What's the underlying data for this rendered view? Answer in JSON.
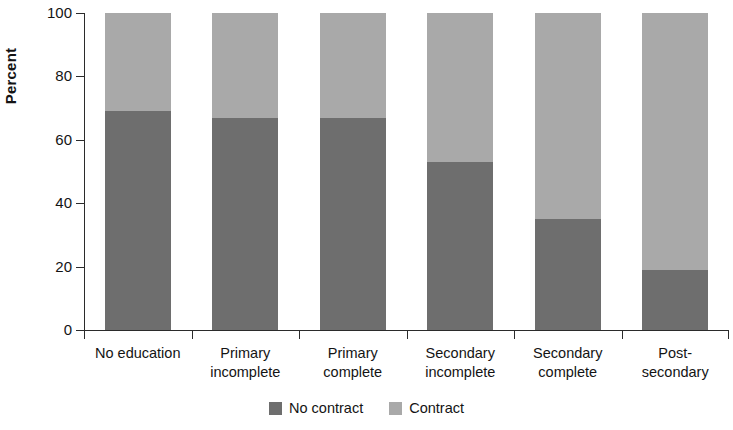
{
  "chart_data": {
    "type": "bar",
    "subtype": "stacked-100-percent-vertical",
    "title": "",
    "subtitle": "",
    "xlabel": "",
    "ylabel": "Percent",
    "ylim": [
      0,
      100
    ],
    "yticks": [
      0,
      20,
      40,
      60,
      80,
      100
    ],
    "ytick_labels": [
      "0",
      "20",
      "40",
      "60",
      "80",
      "100"
    ],
    "grid": false,
    "legend_position": "bottom-center",
    "categories": [
      "No education",
      "Primary incomplete",
      "Primary complete",
      "Secondary incomplete",
      "Secondary complete",
      "Post-secondary"
    ],
    "category_lines": [
      [
        "No education"
      ],
      [
        "Primary",
        "incomplete"
      ],
      [
        "Primary",
        "complete"
      ],
      [
        "Secondary",
        "incomplete"
      ],
      [
        "Secondary",
        "complete"
      ],
      [
        "Post-",
        "secondary"
      ]
    ],
    "series": [
      {
        "name": "No contract",
        "color": "#6e6e6e",
        "values": [
          69,
          67,
          67,
          53,
          35,
          19
        ]
      },
      {
        "name": "Contract",
        "color": "#a9a9a9",
        "values": [
          31,
          33,
          33,
          47,
          65,
          81
        ]
      }
    ],
    "legend": [
      {
        "label": "No contract",
        "color": "#6e6e6e"
      },
      {
        "label": "Contract",
        "color": "#a9a9a9"
      }
    ]
  }
}
